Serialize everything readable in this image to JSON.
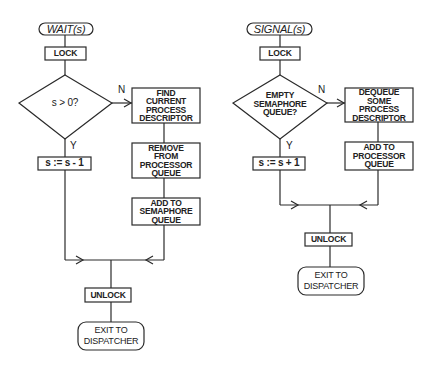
{
  "wait": {
    "title": "WAIT(s)",
    "lock": "LOCK",
    "decision": "s > 0?",
    "no_label": "N",
    "yes_label": "Y",
    "yes_action": "s := s - 1",
    "no_steps": [
      "FIND\nCURRENT\nPROCESS\nDESCRIPTOR",
      "REMOVE\nFROM\nPROCESSOR\nQUEUE",
      "ADD TO\nSEMAPHORE\nQUEUE"
    ],
    "unlock": "UNLOCK",
    "exit": "EXIT TO\nDISPATCHER"
  },
  "signal": {
    "title": "SIGNAL(s)",
    "lock": "LOCK",
    "decision": "EMPTY\nSEMAPHORE\nQUEUE?",
    "no_label": "N",
    "yes_label": "Y",
    "yes_action": "s := s + 1",
    "no_steps": [
      "DEQUEUE\nSOME\nPROCESS\nDESCRIPTOR",
      "ADD TO\nPROCESSOR\nQUEUE"
    ],
    "unlock": "UNLOCK",
    "exit": "EXIT TO\nDISPATCHER"
  }
}
